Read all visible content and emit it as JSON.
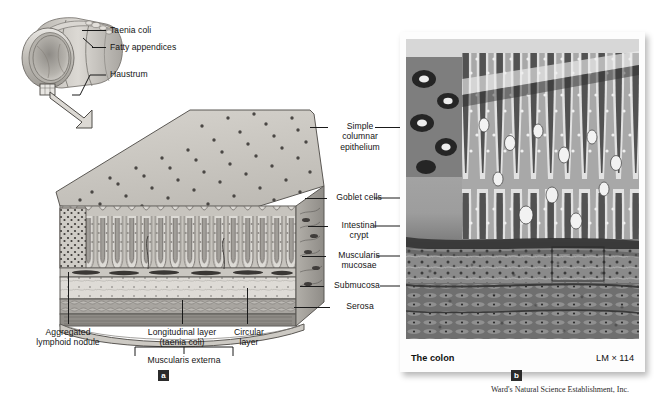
{
  "figure": {
    "panels": [
      {
        "id": "a",
        "badge": "a"
      },
      {
        "id": "b",
        "badge": "b"
      }
    ]
  },
  "gross_anatomy": {
    "labels": [
      {
        "key": "taenia_coli",
        "text": "Taenia coli"
      },
      {
        "key": "fatty_appendices",
        "text": "Fatty appendices"
      },
      {
        "key": "haustrum",
        "text": "Haustrum"
      }
    ]
  },
  "layer_labels": {
    "simple_columnar_epithelium": "Simple\ncolumnar\nepithelium",
    "goblet_cells": "Goblet cells",
    "intestinal_crypt": "Intestinal\ncrypt",
    "muscularis_mucosae": "Muscularis\nmucosae",
    "submucosa": "Submucosa",
    "serosa": "Serosa"
  },
  "bottom_labels": {
    "aggregated_lymphoid_nodule": "Aggregated\nlymphoid nodule",
    "longitudinal_layer": "Longitudinal layer\n(taenia coli)",
    "circular_layer": "Circular\nlayer",
    "muscularis_externa": "Muscularis externa"
  },
  "micrograph": {
    "caption": "The colon",
    "magnification": "LM × 114",
    "badge": "b",
    "credit": "Ward's Natural Science Establishment, Inc."
  },
  "panel_a": {
    "badge": "a"
  },
  "colors": {
    "ink": "#141414",
    "leader": "#1a1a1a",
    "badge_bg": "#2b2b2b",
    "mucosa_top": "#cfcbc4",
    "crypt_layer": "#b9b5ae",
    "submucosa": "#d8d5cf",
    "muscle": "#a9a5a0",
    "serosa": "#c6c3bd",
    "page_bg": "#ffffff"
  }
}
